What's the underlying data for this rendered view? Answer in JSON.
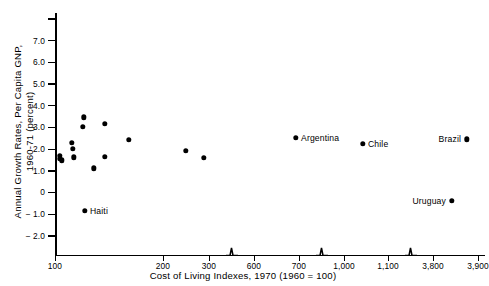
{
  "chart_data": {
    "type": "scatter",
    "title": "",
    "xlabel": "Cost of Living Indexes, 1970 (1960 = 100)",
    "ylabel_line1": "Annual Growth Rates, Per Capita GNP,",
    "ylabel_line2": "1960-71 (percent)",
    "grid": false,
    "legend": "none",
    "ylim": [
      -2.8,
      8.0
    ],
    "y_ticks": [
      {
        "value": 7.0,
        "label": "7.0"
      },
      {
        "value": 6.0,
        "label": "6.0"
      },
      {
        "value": 5.0,
        "label": "5.0"
      },
      {
        "value": 4.0,
        "label": "4.0"
      },
      {
        "value": 3.0,
        "label": "3.0"
      },
      {
        "value": 2.0,
        "label": "2.0"
      },
      {
        "value": 1.0,
        "label": "1.0"
      },
      {
        "value": 0.0,
        "label": "0"
      },
      {
        "value": -1.0,
        "label": "− 1.0"
      },
      {
        "value": -2.0,
        "label": "− 2.0"
      }
    ],
    "y_tick_unlabeled": [
      8.0
    ],
    "x_axis_note": "broken axis with three break marks; segments 100-300, 600-700, 1,000-1,100, 3,800-3,900",
    "x_ticks": [
      {
        "label": "100",
        "px": 55
      },
      {
        "label": "200",
        "px": 163
      },
      {
        "label": "300",
        "px": 209
      },
      {
        "label": "600",
        "px": 254
      },
      {
        "label": "700",
        "px": 299
      },
      {
        "label": "1,000",
        "px": 344
      },
      {
        "label": "1,100",
        "px": 388
      },
      {
        "label": "3,800",
        "px": 433
      },
      {
        "label": "3,900",
        "px": 478
      }
    ],
    "x_breaks_px": [
      232,
      322,
      411
    ],
    "points": [
      {
        "label": "",
        "x_px": 60,
        "growth": 1.7
      },
      {
        "label": "",
        "x_px": 60,
        "growth": 1.55
      },
      {
        "label": "",
        "x_px": 62,
        "growth": 1.48
      },
      {
        "label": "",
        "x_px": 72,
        "growth": 2.3
      },
      {
        "label": "",
        "x_px": 73,
        "growth": 2.02
      },
      {
        "label": "",
        "x_px": 74,
        "growth": 1.62
      },
      {
        "label": "",
        "x_px": 84,
        "growth": 3.47
      },
      {
        "label": "",
        "x_px": 83,
        "growth": 3.02
      },
      {
        "label": "",
        "x_px": 94,
        "growth": 1.12
      },
      {
        "label": "",
        "x_px": 105,
        "growth": 3.18
      },
      {
        "label": "",
        "x_px": 105,
        "growth": 1.65
      },
      {
        "label": "",
        "x_px": 129,
        "growth": 2.43
      },
      {
        "label": "",
        "x_px": 186,
        "growth": 1.92
      },
      {
        "label": "",
        "x_px": 204,
        "growth": 1.6
      },
      {
        "label": "Argentina",
        "x_px": 296,
        "growth": 2.52,
        "side": "right"
      },
      {
        "label": "Chile",
        "x_px": 363,
        "growth": 2.25,
        "side": "right"
      },
      {
        "label": "Brazil",
        "x_px": 467,
        "growth": 2.45,
        "side": "left"
      },
      {
        "label": "Uruguay",
        "x_px": 452,
        "growth": -0.38,
        "side": "left"
      },
      {
        "label": "Haiti",
        "x_px": 85,
        "growth": -0.85,
        "side": "right"
      }
    ],
    "colors": {
      "marker": "#000000",
      "axis": "#000000",
      "background": "#ffffff"
    }
  }
}
